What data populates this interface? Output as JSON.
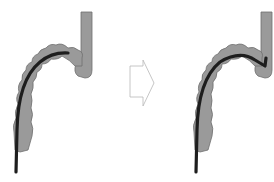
{
  "diagram": {
    "type": "before-after illustration",
    "panels": [
      {
        "id": "before",
        "description": "colon with endoscope partially inserted"
      },
      {
        "id": "after",
        "description": "colon with endoscope advanced to flexure"
      }
    ],
    "arrow": {
      "direction": "right",
      "style": "outlined"
    },
    "colors": {
      "colon_fill": "#9a9a9a",
      "colon_outline": "#6e6e6e",
      "scope": "#1e1e1e",
      "arrow_stroke": "#b8b8b8",
      "background": "#ffffff"
    }
  }
}
